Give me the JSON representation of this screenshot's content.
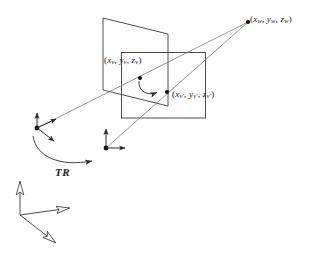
{
  "figure": {
    "stroke_color": "#3a3a3a",
    "text_color": "#1a1a1a",
    "background": "#ffffff"
  },
  "labels": {
    "world_point": {
      "open": "(",
      "x": "x",
      "x_sub": "w",
      "comma1": ", ",
      "y": "y",
      "y_sub": "w",
      "comma2": ", ",
      "z": "z",
      "z_sub": "w",
      "close": ")"
    },
    "view_point": {
      "open": "(",
      "x": "x",
      "x_sub": "v",
      "comma1": ", ",
      "y": "y",
      "y_sub": "v",
      "comma2": ", ",
      "z": "z",
      "z_sub": "v",
      "close": ")"
    },
    "view_point_prime": {
      "open": "(",
      "x": "x",
      "x_sub": "v'",
      "comma1": ", ",
      "y": "y",
      "y_sub": "v'",
      "comma2": ", ",
      "z": "z",
      "z_sub": "v'",
      "close": ")"
    },
    "transform": "TR"
  },
  "geometry": {
    "view_plane_label": "projection plane parallelogram",
    "window_rect_label": "view window rectangle",
    "world_axes_label": "world coordinate frame",
    "view_axes_label": "view coordinate frame",
    "camera_axes_label": "camera coordinate frame"
  }
}
